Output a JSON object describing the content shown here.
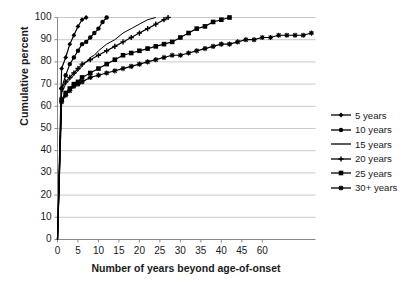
{
  "chart_data": {
    "type": "line",
    "title": "",
    "xlabel": "Number of years beyond age-of-onset",
    "ylabel": "Cumulative percent",
    "xlim": [
      0,
      63
    ],
    "ylim": [
      0,
      100
    ],
    "grid": true,
    "legend_position": "right",
    "xticks": [
      "0",
      "5",
      "10",
      "15",
      "20",
      "25",
      "30",
      "35",
      "40",
      "45",
      "60"
    ],
    "xtick_values": [
      0,
      5,
      10,
      15,
      20,
      25,
      30,
      35,
      40,
      45,
      50
    ],
    "yticks": [
      "0",
      "10",
      "20",
      "30",
      "40",
      "50",
      "60",
      "70",
      "80",
      "90",
      "100"
    ],
    "ytick_values": [
      0,
      10,
      20,
      30,
      40,
      50,
      60,
      70,
      80,
      90,
      100
    ],
    "series": [
      {
        "name": "5 years",
        "marker": "small-diamond",
        "x": [
          0,
          1,
          2,
          3,
          4,
          5,
          6,
          7
        ],
        "y": [
          0,
          77,
          82,
          88,
          92,
          96,
          99,
          100
        ]
      },
      {
        "name": "10 years",
        "marker": "circle",
        "x": [
          0,
          1,
          2,
          3,
          4,
          5,
          6,
          7,
          8,
          9,
          10,
          11,
          12
        ],
        "y": [
          0,
          68,
          74,
          79,
          82,
          85,
          88,
          89,
          91,
          93,
          95,
          98,
          100
        ]
      },
      {
        "name": "15 years",
        "marker": "none",
        "x": [
          0,
          1,
          2,
          3,
          4,
          5,
          6,
          7,
          8,
          9,
          10,
          12,
          14,
          16,
          18,
          20,
          22,
          24
        ],
        "y": [
          0,
          66,
          70,
          72,
          74,
          76,
          78,
          80,
          82,
          83,
          85,
          88,
          90,
          93,
          95,
          97,
          99,
          100
        ]
      },
      {
        "name": "20 years",
        "marker": "plus",
        "x": [
          0,
          1,
          2,
          3,
          4,
          5,
          6,
          8,
          10,
          12,
          14,
          16,
          18,
          20,
          22,
          24,
          26,
          27
        ],
        "y": [
          0,
          68,
          71,
          73,
          75,
          77,
          79,
          81,
          83,
          85,
          87,
          89,
          91,
          93,
          95,
          97,
          99,
          100
        ]
      },
      {
        "name": "25 years",
        "marker": "square",
        "x": [
          0,
          1,
          2,
          3,
          4,
          5,
          6,
          8,
          10,
          12,
          14,
          16,
          18,
          20,
          22,
          24,
          26,
          28,
          30,
          32,
          34,
          36,
          38,
          40,
          42
        ],
        "y": [
          0,
          63,
          66,
          68,
          70,
          71,
          73,
          75,
          77,
          79,
          81,
          83,
          84,
          85,
          86,
          87,
          88,
          89,
          91,
          93,
          95,
          96,
          98,
          99,
          100
        ]
      },
      {
        "name": "30+ years",
        "marker": "star",
        "x": [
          0,
          1,
          2,
          3,
          4,
          5,
          6,
          8,
          10,
          12,
          14,
          16,
          18,
          20,
          22,
          24,
          26,
          28,
          30,
          32,
          34,
          36,
          38,
          40,
          42,
          44,
          46,
          48,
          50,
          52,
          54,
          56,
          58,
          60,
          62
        ],
        "y": [
          0,
          62,
          65,
          67,
          69,
          70,
          71,
          73,
          74,
          75,
          76,
          77,
          78,
          79,
          80,
          81,
          82,
          83,
          83,
          84,
          85,
          86,
          87,
          88,
          88,
          89,
          90,
          90,
          91,
          91,
          92,
          92,
          92,
          92,
          93
        ]
      }
    ]
  },
  "colors": {
    "line": "#000000",
    "grid": "#c9c9c9",
    "axis": "#8a8a8a",
    "text": "#1a1a1a"
  }
}
